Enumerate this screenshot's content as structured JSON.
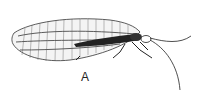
{
  "figure": {
    "label": "A"
  }
}
